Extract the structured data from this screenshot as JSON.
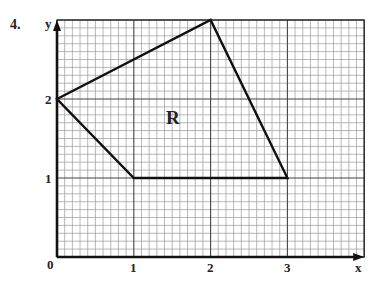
{
  "problem_number": "4.",
  "axes": {
    "x_label": "x",
    "y_label": "y",
    "origin_label": "0",
    "x_ticks": [
      "1",
      "2",
      "3"
    ],
    "y_ticks": [
      "1",
      "2"
    ]
  },
  "region_label": "R",
  "region": {
    "vertices": [
      [
        0,
        2
      ],
      [
        2,
        3
      ],
      [
        3,
        1
      ],
      [
        1,
        1
      ]
    ]
  },
  "grid": {
    "x_range": [
      0,
      4
    ],
    "y_range": [
      0,
      3
    ],
    "subdivisions_per_unit": 10
  },
  "colors": {
    "grid_minor": "#9a9a9a",
    "grid_major": "#444444",
    "outline": "#111111"
  }
}
